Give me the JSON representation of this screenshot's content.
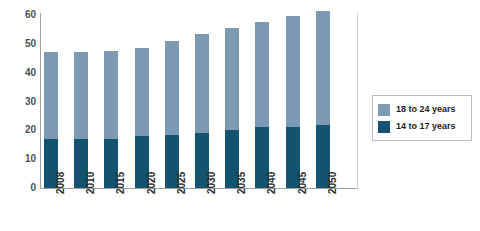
{
  "chart_data": {
    "type": "bar",
    "title": "",
    "subtitle": "",
    "xlabel": "",
    "ylabel": "",
    "stacked": true,
    "grid": false,
    "legend_position": "right",
    "ylim": [
      0,
      60
    ],
    "y_ticks": [
      "0",
      "10",
      "20",
      "30",
      "40",
      "50",
      "60"
    ],
    "y_tick_values": [
      0,
      10,
      20,
      30,
      40,
      50,
      60
    ],
    "categories": [
      "2008",
      "2010",
      "2015",
      "2020",
      "2025",
      "2030",
      "2035",
      "2040",
      "2045",
      "2050"
    ],
    "series": [
      {
        "name": "14 to 17 years",
        "color": "#14536f",
        "values": [
          17,
          17,
          17,
          18,
          18.5,
          19,
          20,
          21,
          21,
          22
        ]
      },
      {
        "name": "18 to 24 years",
        "color": "#7d9ab4",
        "values": [
          30,
          30,
          30.5,
          30.5,
          32.5,
          34.5,
          35.5,
          36.5,
          38.5,
          39.5
        ]
      }
    ],
    "totals": [
      47,
      47,
      47.5,
      48.5,
      51,
      53.5,
      55.5,
      57.5,
      59.5,
      61.5
    ]
  },
  "legend": {
    "items": [
      {
        "label": "18 to 24 years",
        "color": "#7d9ab4"
      },
      {
        "label": "14 to 17 years",
        "color": "#14536f"
      }
    ]
  },
  "colors": {
    "light_blue": "#7d9ab4",
    "dark_blue": "#14536f",
    "axis": "#9aa0a4",
    "text": "#2b2f31",
    "background": "#ffffff"
  }
}
